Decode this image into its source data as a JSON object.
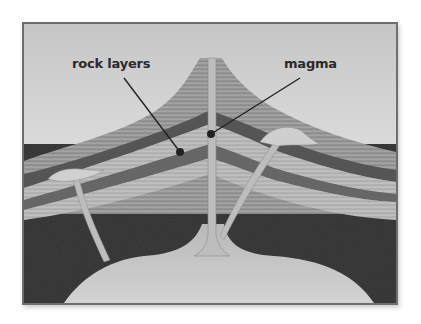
{
  "diagram": {
    "labels": [
      {
        "id": "rock-layers",
        "text": "rock layers"
      },
      {
        "id": "magma",
        "text": "magma"
      }
    ],
    "colors": {
      "sky_top": "#c9c9c9",
      "sky_bottom": "#f4f4f4",
      "rock_layer_light": "#b5b5b5",
      "rock_layer_mid": "#8d8d8d",
      "rock_layer_dark": "#5a5a5a",
      "bedrock": "#3a3a3a",
      "magma": "#c4c4c4",
      "frame": "#6e6e6e",
      "label_text": "#2a2a2a"
    }
  }
}
